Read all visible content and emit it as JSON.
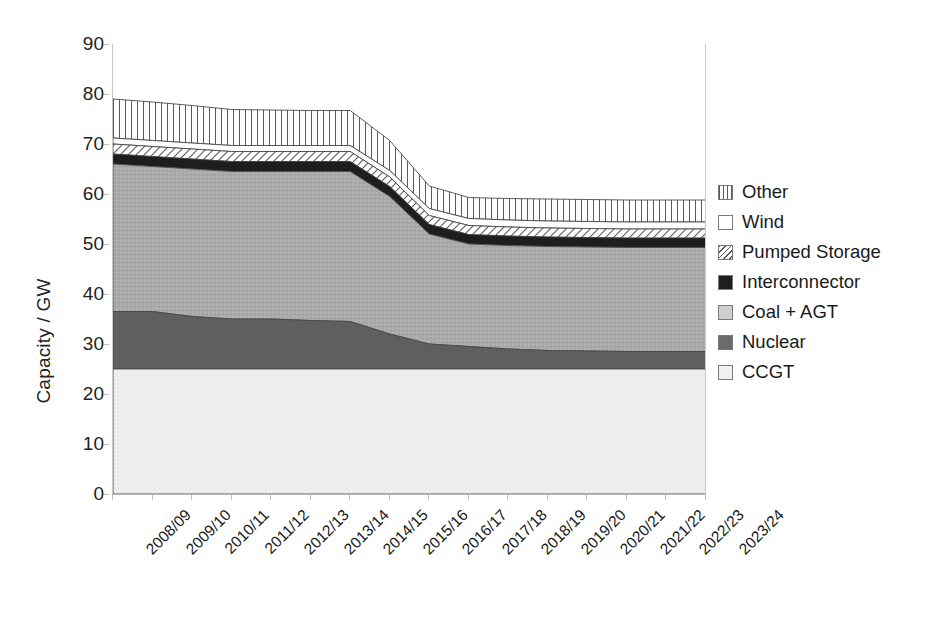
{
  "chart_data": {
    "type": "area",
    "title": "",
    "xlabel": "",
    "ylabel": "Capacity / GW",
    "ylim": [
      0,
      90
    ],
    "ytick_values": [
      0,
      10,
      20,
      30,
      40,
      50,
      60,
      70,
      80,
      90
    ],
    "ytick_labels": [
      "0",
      "10",
      "20",
      "30",
      "40",
      "50",
      "60",
      "70",
      "80",
      "90"
    ],
    "grid": false,
    "legend_position": "right",
    "stacked": true,
    "stack_order_bottom_to_top": [
      "CCGT",
      "Nuclear",
      "Coal + AGT",
      "Interconnector",
      "Pumped Storage",
      "Wind",
      "Other"
    ],
    "categories": [
      "2008/09",
      "2009/10",
      "2010/11",
      "2011/12",
      "2012/13",
      "2013/14",
      "2014/15",
      "2015/16",
      "2016/17",
      "2017/18",
      "2018/19",
      "2019/20",
      "2020/21",
      "2021/22",
      "2022/23",
      "2023/24"
    ],
    "series": [
      {
        "name": "CCGT",
        "fill": "#efefef",
        "pattern": "fine-speckle",
        "values": [
          25.0,
          25.0,
          25.0,
          25.0,
          25.0,
          25.0,
          25.0,
          25.0,
          25.0,
          25.0,
          25.0,
          25.0,
          25.0,
          25.0,
          25.0,
          25.0
        ]
      },
      {
        "name": "Nuclear",
        "fill": "#5f5f5f",
        "pattern": "solid",
        "values": [
          11.5,
          11.5,
          10.5,
          10.0,
          10.0,
          9.7,
          9.5,
          7.0,
          5.0,
          4.5,
          4.0,
          3.7,
          3.6,
          3.5,
          3.5,
          3.5
        ]
      },
      {
        "name": "Coal + AGT",
        "fill": "#a8a8a8",
        "pattern": "coarse-speckle",
        "values": [
          29.5,
          29.0,
          29.5,
          29.5,
          29.5,
          29.8,
          30.0,
          27.5,
          22.0,
          20.5,
          20.7,
          20.8,
          20.8,
          20.8,
          20.8,
          20.8
        ]
      },
      {
        "name": "Interconnector",
        "fill": "#1e1e1e",
        "pattern": "solid",
        "values": [
          2.0,
          2.0,
          2.0,
          2.0,
          2.0,
          2.0,
          2.0,
          2.0,
          1.9,
          1.9,
          1.9,
          1.9,
          1.9,
          1.9,
          1.9,
          1.9
        ]
      },
      {
        "name": "Pumped Storage",
        "fill": "#ffffff",
        "pattern": "diagonal-hatch",
        "values": [
          2.0,
          2.0,
          2.0,
          2.0,
          2.0,
          2.0,
          2.0,
          1.9,
          1.8,
          1.8,
          1.8,
          1.8,
          1.8,
          1.8,
          1.8,
          1.8
        ]
      },
      {
        "name": "Wind",
        "fill": "#ffffff",
        "pattern": "none",
        "values": [
          1.2,
          1.2,
          1.2,
          1.2,
          1.2,
          1.2,
          1.2,
          1.3,
          1.4,
          1.4,
          1.4,
          1.4,
          1.4,
          1.4,
          1.4,
          1.4
        ]
      },
      {
        "name": "Other",
        "fill": "#ffffff",
        "pattern": "vertical-lines",
        "values": [
          7.8,
          7.7,
          7.5,
          7.2,
          7.1,
          7.0,
          7.0,
          6.0,
          4.5,
          4.2,
          4.3,
          4.4,
          4.4,
          4.4,
          4.4,
          4.4
        ]
      }
    ],
    "cumulative_top_of_stack": [
      79.0,
      78.4,
      77.7,
      76.9,
      76.8,
      76.7,
      76.7,
      70.7,
      61.6,
      59.3,
      59.1,
      59.0,
      58.9,
      58.8,
      58.8,
      58.8
    ]
  },
  "legend": {
    "items": [
      {
        "label": "Other",
        "swatch": "vertical-lines-swatch",
        "fill": "#ffffff",
        "pattern": "vertical-lines"
      },
      {
        "label": "Wind",
        "swatch": "empty-swatch",
        "fill": "#ffffff",
        "pattern": "none"
      },
      {
        "label": "Pumped Storage",
        "swatch": "diagonal-hatch-swatch",
        "fill": "#ffffff",
        "pattern": "diagonal-hatch"
      },
      {
        "label": "Interconnector",
        "swatch": "solid-dark-swatch",
        "fill": "#1e1e1e",
        "pattern": "solid"
      },
      {
        "label": "Coal + AGT",
        "swatch": "light-gray-swatch",
        "fill": "#cfcfcf",
        "pattern": "coarse-speckle"
      },
      {
        "label": "Nuclear",
        "swatch": "mid-gray-swatch",
        "fill": "#6b6b6b",
        "pattern": "solid"
      },
      {
        "label": "CCGT",
        "swatch": "very-light-gray-swatch",
        "fill": "#f0f0f0",
        "pattern": "fine-speckle"
      }
    ]
  }
}
